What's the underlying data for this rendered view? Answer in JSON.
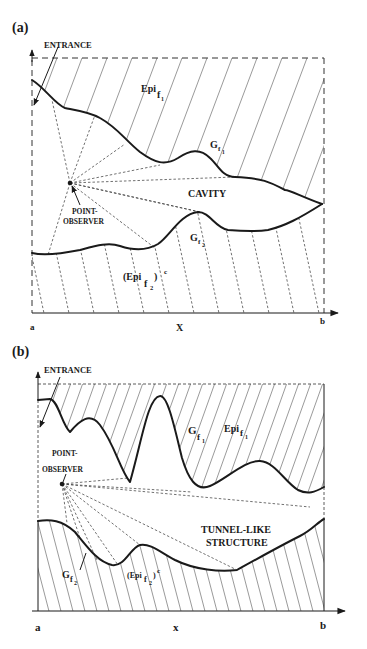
{
  "figure": {
    "panels": [
      {
        "id": "a",
        "panel_label": "(a)",
        "entrance_label": "ENTRANCE",
        "epi_top_label": "Epi",
        "epi_top_sub": "f",
        "epi_top_subsub": "1",
        "graph_top_label": "G",
        "graph_top_sub": "f",
        "graph_top_subsub": "1",
        "region_label": "CAVITY",
        "observer_label_line1": "POINT-",
        "observer_label_line2": "OBSERVER",
        "graph_bottom_label": "G",
        "graph_bottom_sub": "f",
        "graph_bottom_subsub": "2",
        "complement_label": "(Epi",
        "complement_sub": "f",
        "complement_subsub": "2",
        "complement_close": ")",
        "complement_sup": "c",
        "axis_start": "a",
        "axis_mid": "X",
        "axis_end": "b"
      },
      {
        "id": "b",
        "panel_label": "(b)",
        "entrance_label": "ENTRANCE",
        "epi_top_label": "Epi",
        "epi_top_sub": "f",
        "epi_top_subsub": "1",
        "graph_top_label": "G",
        "graph_top_sub": "f",
        "graph_top_subsub": "1",
        "region_label_line1": "TUNNEL-LIKE",
        "region_label_line2": "STRUCTURE",
        "observer_label_line1": "POINT-",
        "observer_label_line2": "OBSERVER",
        "graph_bottom_label": "G",
        "graph_bottom_sub": "f",
        "graph_bottom_subsub": "2",
        "complement_label": "(Epi",
        "complement_sub": "f",
        "complement_subsub": "2",
        "complement_close": ")",
        "complement_sup": "c",
        "axis_start": "a",
        "axis_mid": "x",
        "axis_end": "b"
      }
    ]
  }
}
